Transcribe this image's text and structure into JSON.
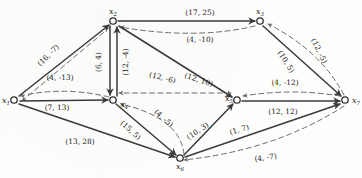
{
  "diagram": {
    "type": "directed-network",
    "node_label_prefix": "x",
    "nodes": [
      {
        "id": "x1",
        "label": "x",
        "sub": "1",
        "x": 14,
        "y": 100,
        "label_dx": -12,
        "label_dy": 3
      },
      {
        "id": "x2",
        "label": "x",
        "sub": "2",
        "x": 113,
        "y": 21,
        "label_dx": -4,
        "label_dy": -7
      },
      {
        "id": "x3",
        "label": "x",
        "sub": "3",
        "x": 260,
        "y": 21,
        "label_dx": -4,
        "label_dy": -7
      },
      {
        "id": "x4",
        "label": "x",
        "sub": "4",
        "x": 113,
        "y": 100,
        "label_dx": 7,
        "label_dy": 7
      },
      {
        "id": "x5",
        "label": "x",
        "sub": "5",
        "x": 237,
        "y": 100,
        "label_dx": -12,
        "label_dy": 1
      },
      {
        "id": "x6",
        "label": "x",
        "sub": "6",
        "x": 180,
        "y": 158,
        "label_dx": -4,
        "label_dy": 11
      },
      {
        "id": "x7",
        "label": "x",
        "sub": "7",
        "x": 345,
        "y": 100,
        "label_dx": 7,
        "label_dy": 3
      }
    ],
    "edges": [
      {
        "name": "edge-x2-x3",
        "from": "x2",
        "to": "x3",
        "style": "solid",
        "label": "(17, 25)",
        "label_x": 200,
        "label_y": 15,
        "label_rot": 0
      },
      {
        "name": "edge-x3-x2",
        "from": "x3",
        "to": "x2",
        "style": "dashed",
        "label": "(4, -10)",
        "label_x": 200,
        "label_y": 42,
        "label_rot": 0
      },
      {
        "name": "edge-x2-x1",
        "from": "x2",
        "to": "x1",
        "style": "dashed",
        "label": "(16, -7)",
        "label_x": 50,
        "label_y": 57,
        "label_rot": -45
      },
      {
        "name": "edge-x1-x2",
        "from": "x1",
        "to": "x2",
        "style": "solid",
        "label": "",
        "label_x": 0,
        "label_y": 0,
        "label_rot": 0
      },
      {
        "name": "edge-x4-x1",
        "from": "x4",
        "to": "x1",
        "style": "dashed",
        "label": "(4, -13)",
        "label_x": 60,
        "label_y": 80,
        "label_rot": 0
      },
      {
        "name": "edge-x1-x4",
        "from": "x1",
        "to": "x4",
        "style": "solid",
        "label": "(7, 13)",
        "label_x": 57,
        "label_y": 109,
        "label_rot": 0
      },
      {
        "name": "edge-x2-x4",
        "from": "x2",
        "to": "x4",
        "style": "solid",
        "label": "(6, 4)",
        "label_x": 100,
        "label_y": 62,
        "label_rot": -90
      },
      {
        "name": "edge-x4-x2",
        "from": "x4",
        "to": "x2",
        "style": "solid",
        "label": "(12, -4)",
        "label_x": 126,
        "label_y": 62,
        "label_rot": -90
      },
      {
        "name": "edge-x5-x4",
        "from": "x5",
        "to": "x4",
        "style": "dashed",
        "label": "(12, -6)",
        "label_x": 160,
        "label_y": 78,
        "label_rot": 17
      },
      {
        "name": "edge-x2-x5",
        "from": "x2",
        "to": "x5",
        "style": "solid",
        "label": "(12, 10)",
        "label_x": 196,
        "label_y": 80,
        "label_rot": 19
      },
      {
        "name": "edge-x3-x7",
        "from": "x3",
        "to": "x7",
        "style": "solid",
        "label": "(10, 5)",
        "label_x": 283,
        "label_y": 62,
        "label_rot": 57
      },
      {
        "name": "edge-x7-x3",
        "from": "x7",
        "to": "x3",
        "style": "dashed",
        "label": "(12, -5)",
        "label_x": 316,
        "label_y": 52,
        "label_rot": 64
      },
      {
        "name": "edge-x7-x5",
        "from": "x7",
        "to": "x5",
        "style": "dashed",
        "label": "(4, -12)",
        "label_x": 268,
        "label_y": 85,
        "label_rot": 0
      },
      {
        "name": "edge-x5-x7",
        "from": "x5",
        "to": "x7",
        "style": "solid",
        "label": "(12, 12)",
        "label_x": 272,
        "label_y": 113,
        "label_rot": 0
      },
      {
        "name": "edge-x4-x6",
        "from": "x4",
        "to": "x6",
        "style": "solid",
        "label": "(15, 5)",
        "label_x": 126,
        "label_y": 130,
        "label_rot": 42
      },
      {
        "name": "edge-x6-x4",
        "from": "x6",
        "to": "x4",
        "style": "dashed",
        "label": "(4, -5)",
        "label_x": 158,
        "label_y": 120,
        "label_rot": 42
      },
      {
        "name": "edge-x1-x6",
        "from": "x1",
        "to": "x6",
        "style": "solid",
        "label": "(13, 28)",
        "label_x": 78,
        "label_y": 142,
        "label_rot": 0
      },
      {
        "name": "edge-x6-x5",
        "from": "x6",
        "to": "x5",
        "style": "solid",
        "label": "(10, 3)",
        "label_x": 196,
        "label_y": 131,
        "label_rot": -33
      },
      {
        "name": "edge-x6-x7",
        "from": "x6",
        "to": "x7",
        "style": "solid",
        "label": "(1, 7)",
        "label_x": 238,
        "label_y": 131,
        "label_rot": -16
      },
      {
        "name": "edge-x7-x6",
        "from": "x7",
        "to": "x6",
        "style": "dashed",
        "label": "(4, -7)",
        "label_x": 264,
        "label_y": 158,
        "label_rot": -8
      }
    ]
  }
}
